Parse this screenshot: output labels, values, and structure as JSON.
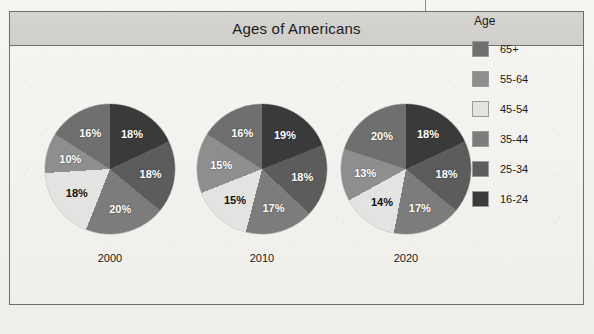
{
  "figure": {
    "title": "Ages of Americans"
  },
  "legend": {
    "title": "Age",
    "items": [
      {
        "label": "65+",
        "color": "#6f6f6f"
      },
      {
        "label": "55-64",
        "color": "#8e8e8e"
      },
      {
        "label": "45-54",
        "color": "#e3e3e1"
      },
      {
        "label": "35-44",
        "color": "#7c7c7c"
      },
      {
        "label": "25-34",
        "color": "#5c5c5c"
      },
      {
        "label": "16-24",
        "color": "#3a3a3a"
      }
    ]
  },
  "chart_data": {
    "type": "pie",
    "title": "Ages of Americans",
    "legend_title": "Age",
    "legend_position": "right",
    "categories": [
      "16-24",
      "25-34",
      "35-44",
      "45-54",
      "55-64",
      "65+"
    ],
    "colors": [
      "#3a3a3a",
      "#5c5c5c",
      "#7c7c7c",
      "#e3e3e1",
      "#8e8e8e",
      "#6f6f6f"
    ],
    "units": "percent",
    "charts": [
      {
        "label": "2000",
        "values": [
          18,
          18,
          20,
          18,
          10,
          16
        ],
        "value_labels": [
          "18%",
          "18%",
          "20%",
          "18%",
          "10%",
          "16%"
        ]
      },
      {
        "label": "2010",
        "values": [
          19,
          18,
          17,
          15,
          15,
          16
        ],
        "value_labels": [
          "19%",
          "18%",
          "17%",
          "15%",
          "15%",
          "16%"
        ]
      },
      {
        "label": "2020",
        "values": [
          18,
          18,
          17,
          14,
          13,
          20
        ],
        "value_labels": [
          "18%",
          "18%",
          "17%",
          "14%",
          "13%",
          "20%"
        ]
      }
    ]
  },
  "page": {
    "body_text_placeholder": "…"
  }
}
